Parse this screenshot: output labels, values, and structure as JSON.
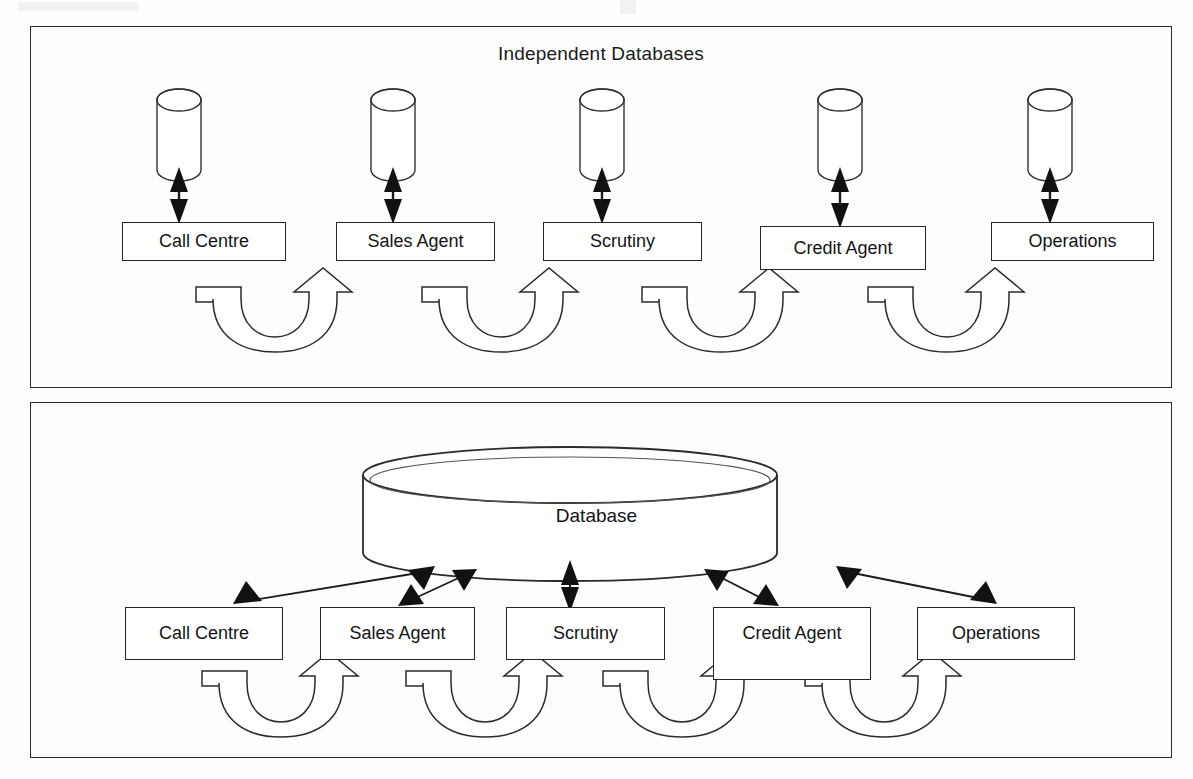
{
  "figure": {
    "type": "diagram",
    "panels": [
      {
        "id": "independent",
        "title": "Independent Databases",
        "has_title": true,
        "nodes": [
          {
            "label": "Call Centre",
            "db_icon": "cylinder-icon",
            "link": "double-headed-vertical-arrow"
          },
          {
            "label": "Sales Agent",
            "db_icon": "cylinder-icon",
            "link": "double-headed-vertical-arrow"
          },
          {
            "label": "Scrutiny",
            "db_icon": "cylinder-icon",
            "link": "double-headed-vertical-arrow"
          },
          {
            "label": "Credit Agent",
            "db_icon": "cylinder-icon",
            "link": "double-headed-vertical-arrow"
          },
          {
            "label": "Operations",
            "db_icon": "cylinder-icon",
            "link": "double-headed-vertical-arrow"
          }
        ],
        "flow_arrows": 4,
        "flow_arrow_icon": "curved-u-turn-arrow-icon"
      },
      {
        "id": "central",
        "title": "",
        "has_title": false,
        "central_db": {
          "label": "Database",
          "icon": "large-cylinder-icon"
        },
        "nodes": [
          {
            "label": "Call Centre",
            "link": "double-headed-diagonal-arrow"
          },
          {
            "label": "Sales Agent",
            "link": "double-headed-diagonal-arrow"
          },
          {
            "label": "Scrutiny",
            "link": "double-headed-vertical-arrow"
          },
          {
            "label": "Credit Agent",
            "link": "double-headed-diagonal-arrow"
          },
          {
            "label": "Operations",
            "link": "double-headed-diagonal-arrow"
          }
        ],
        "flow_arrows": 4,
        "flow_arrow_icon": "curved-u-turn-arrow-icon"
      }
    ],
    "colors": {
      "stroke": "#262626",
      "fill": "#ffffff",
      "background": "#fdfdfd",
      "text": "#141414"
    }
  }
}
